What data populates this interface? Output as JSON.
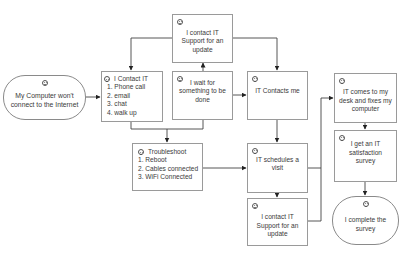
{
  "diagram": {
    "type": "customer-journey-flowchart",
    "nodes": {
      "start": {
        "text": "My Computer won't connect to the Internet",
        "face": "sad",
        "shape": "oval"
      },
      "contact_it": {
        "title": "I Contact IT",
        "face": "neutral",
        "items": [
          "1. Phone call",
          "2. email",
          "3. chat",
          "4. walk up"
        ]
      },
      "contact_support_top": {
        "text": "I contact IT Support for an update",
        "face": "sad"
      },
      "wait": {
        "text": "I wait for something to be done",
        "face": "sad"
      },
      "it_contacts": {
        "text": "IT Contacts me",
        "face": "happy"
      },
      "troubleshoot": {
        "title": "Troubleshoot",
        "face": "neutral",
        "items": [
          "1. Reboot",
          "2. Cables connected",
          "3. WiFi Connected"
        ]
      },
      "schedules_visit": {
        "text": "IT schedules a visit",
        "face": "happy"
      },
      "contact_support_bottom": {
        "text": "I contact IT Support for an update",
        "face": "sad"
      },
      "it_comes": {
        "text": "IT comes to my desk and fixes my computer",
        "face": "happy"
      },
      "survey": {
        "text": "I get an IT satisfaction survey",
        "face": "happy"
      },
      "end": {
        "text": "I complete the survey",
        "face": "happy",
        "shape": "oval"
      }
    },
    "edges": [
      [
        "start",
        "contact_it"
      ],
      [
        "contact_support_top",
        "contact_it"
      ],
      [
        "contact_support_top",
        "it_contacts"
      ],
      [
        "wait",
        "contact_support_top"
      ],
      [
        "contact_it",
        "troubleshoot"
      ],
      [
        "wait",
        "it_contacts"
      ],
      [
        "it_contacts",
        "schedules_visit"
      ],
      [
        "troubleshoot",
        "schedules_visit"
      ],
      [
        "schedules_visit",
        "contact_support_bottom"
      ],
      [
        "schedules_visit",
        "it_comes"
      ],
      [
        "contact_support_bottom",
        "it_comes"
      ],
      [
        "it_comes",
        "survey"
      ],
      [
        "survey",
        "end"
      ]
    ],
    "colors": {
      "border": "#9a9a9a",
      "line": "#333333",
      "text": "#3a3a3a"
    }
  }
}
